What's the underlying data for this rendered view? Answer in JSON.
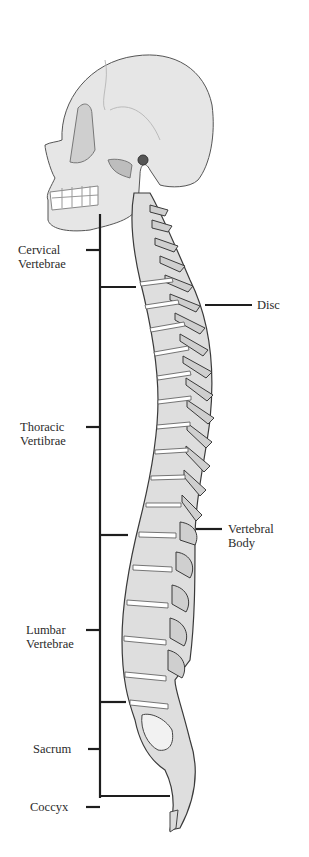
{
  "diagram": {
    "left_labels": [
      {
        "id": "cervical",
        "lines": [
          "Cervical",
          "Vertebrae"
        ]
      },
      {
        "id": "thoracic",
        "lines": [
          "Thoracic",
          "Vertibrae"
        ]
      },
      {
        "id": "lumbar",
        "lines": [
          "Lumbar",
          "Vertebrae"
        ]
      },
      {
        "id": "sacrum",
        "lines": [
          "Sacrum"
        ]
      },
      {
        "id": "coccyx",
        "lines": [
          "Coccyx"
        ]
      }
    ],
    "right_labels": [
      {
        "id": "disc",
        "lines": [
          "Disc"
        ]
      },
      {
        "id": "vertebral-body",
        "lines": [
          "Vertebral",
          "Body"
        ]
      }
    ],
    "colors": {
      "bone": "#e4e4e4",
      "bone_shade": "#b9b9b9",
      "outline": "#3a3a3a",
      "line": "#1e1e1e",
      "background": "#ffffff"
    }
  }
}
